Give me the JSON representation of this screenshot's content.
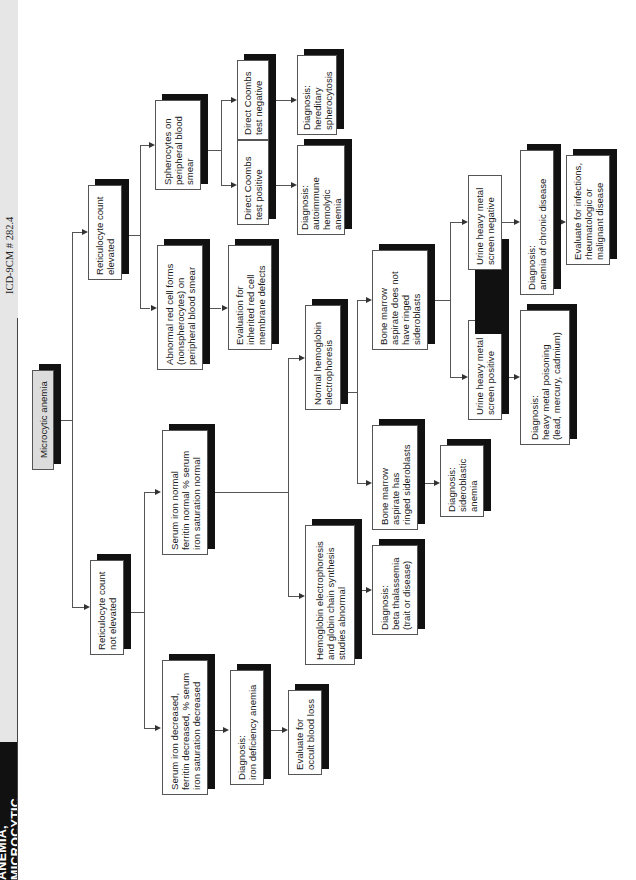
{
  "header": {
    "title": "ANEMIA, MICROCYTIC",
    "icd_code": "ICD-9CM # 282.4"
  },
  "nodes": {
    "root": "Microcytic anemia",
    "retic_not_elevated": "Reticulocyte count\nnot elevated",
    "retic_elevated": "Reticulocyte count\nelevated",
    "serum_iron_decreased": "Serum iron decreased,\nferritin decreased, % serum\niron saturation decreased",
    "serum_iron_normal": "Serum iron normal\nferritin normal % serum\niron saturation normal",
    "dx_iron_deficiency": "Diagnosis:\niron deficiency anemia",
    "evaluate_occult": "Evaluate for\noccult blood loss",
    "hb_electrophoresis_abnormal": "Hemoglobin electrophoresis\nand globin chain synthesis\nstudies abnormal",
    "normal_hb_electrophoresis": "Normal hemoglobin\nelectrophoresis",
    "dx_beta_thal": "Diagnosis:\nbeta thalassemia\n(trait or disease)",
    "bm_ringed": "Bone marrow\naspirate has\nringed sideroblasts",
    "dx_sideroblastic": "Diagnosis:\nsideroblastic\nanemia",
    "bm_not_ringed": "Bone marrow\naspirate does not\nhave ringed\nsideroblasts",
    "urine_positive": "Urine heavy metal\nscreen positive",
    "urine_negative": "Urine heavy metal\nscreen negative",
    "dx_heavy_metal": "Diagnosis:\nheavy metal poisoning\n(lead, mercury, cadmium)",
    "dx_chronic_disease": "Diagnosis:\nanemia of chronic disease",
    "evaluate_infections": "Evaluate for infections,\nrheumatologic or\nmalignant disease",
    "abnormal_red_cell_forms": "Abnormal red cell forms\n(nonspherocytes) on\nperipheral blood smear",
    "evaluation_inherited": "Evaluation for\ninherited red cell\nmembrane defects",
    "spherocytes": "Spherocytes on\nperipheral blood\nsmear",
    "coombs_positive": "Direct Coombs\ntest positive",
    "coombs_negative": "Direct Coombs\ntest negative",
    "dx_autoimmune": "Diagnosis:\nautoimmune\nhemolytic\nanemia",
    "dx_hereditary_spherocytosis": "Diagnosis:\nhereditary\nspherocytosis"
  },
  "colors": {
    "shadow": "#111111",
    "root_fill": "#dcdcdc",
    "strip": "#e6e6e6"
  }
}
